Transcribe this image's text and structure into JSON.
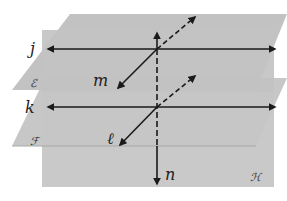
{
  "colors": {
    "background": "#ffffff",
    "plane_H": "#c9c9c9",
    "plane_E": "#bdbdbd",
    "plane_F": "#c2c2c2",
    "plane_edge": "#a8a8a8",
    "line": "#1a1a1a"
  },
  "planes": {
    "E": {
      "label": "ℰ"
    },
    "F": {
      "label": "ℱ"
    },
    "H": {
      "label": "ℋ"
    }
  },
  "lines": {
    "j": {
      "label": "j"
    },
    "k": {
      "label": "k"
    },
    "m": {
      "label": "m"
    },
    "l": {
      "label": "ℓ"
    },
    "n": {
      "label": "n"
    }
  }
}
